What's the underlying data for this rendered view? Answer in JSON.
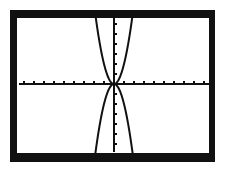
{
  "chart_data": {
    "type": "line",
    "title": "",
    "xlabel": "",
    "ylabel": "",
    "xlim": [
      -9.5,
      9.5
    ],
    "ylim": [
      -6.8,
      6.7
    ],
    "xscale_tick": 1,
    "yscale_tick": 1,
    "grid": false,
    "legend": null,
    "series": [
      {
        "name": "y = 2x^2",
        "expression": "2*x^2",
        "x": [
          -1.8,
          -1.5,
          -1,
          -0.5,
          0,
          0.5,
          1,
          1.5,
          1.8
        ],
        "values": [
          6.48,
          4.5,
          2,
          0.5,
          0,
          0.5,
          2,
          4.5,
          6.48
        ]
      },
      {
        "name": "y = -2x^2",
        "expression": "-2*x^2",
        "x": [
          -1.8,
          -1.5,
          -1,
          -0.5,
          0,
          0.5,
          1,
          1.5,
          1.8
        ],
        "values": [
          -6.48,
          -4.5,
          -2,
          -0.5,
          0,
          -0.5,
          -2,
          -4.5,
          -6.48
        ]
      }
    ],
    "style": {
      "line_color": "#111111",
      "background": "#ffffff",
      "frame_color": "#111111",
      "pixelated": true
    }
  },
  "labels": {
    "description": "Graphing calculator screen with two parabolas through the origin"
  }
}
